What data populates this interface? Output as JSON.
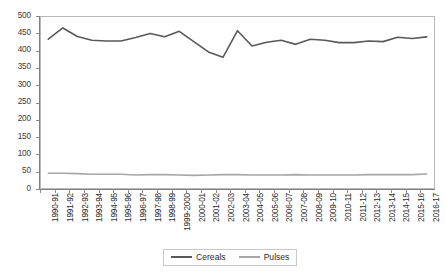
{
  "chart_data": {
    "type": "line",
    "title": "",
    "subtitle": "",
    "xlabel": "",
    "ylabel": "",
    "ylim": [
      0,
      500
    ],
    "ytick_step": 50,
    "yticks": [
      500,
      450,
      400,
      350,
      300,
      250,
      200,
      150,
      100,
      50,
      0
    ],
    "grid": false,
    "legend_position": "bottom-center",
    "categories": [
      "1990-91",
      "1991-92",
      "1992-93",
      "1993-94",
      "1994-95",
      "1995-96",
      "1996-97",
      "1997-98",
      "1998-99",
      "1999-2000",
      "2000-01",
      "2001-02",
      "2002-03",
      "2003-04",
      "2004-05",
      "2005-06",
      "2006-07",
      "2007-08",
      "2008-09",
      "2009-10",
      "2010-11",
      "2011-12",
      "2012-13",
      "2013-14",
      "2014-15",
      "2015-16",
      "2016-17"
    ],
    "series": [
      {
        "name": "Cereals",
        "color": "#595959",
        "values": [
          435,
          468,
          443,
          432,
          430,
          430,
          440,
          452,
          442,
          458,
          428,
          398,
          382,
          460,
          415,
          426,
          432,
          420,
          435,
          432,
          425,
          425,
          430,
          428,
          441,
          437,
          442
        ]
      },
      {
        "name": "Pulses",
        "color": "#a6a6a6",
        "values": [
          43,
          43,
          42,
          40,
          40,
          40,
          38,
          39,
          39,
          38,
          37,
          38,
          39,
          39,
          38,
          38,
          38,
          39,
          38,
          38,
          38,
          38,
          39,
          39,
          39,
          39,
          41
        ]
      }
    ],
    "legend": [
      {
        "label": "Cereals",
        "color": "#595959"
      },
      {
        "label": "Pulses",
        "color": "#a6a6a6"
      }
    ]
  },
  "legend": {
    "cereals_label": "Cereals",
    "pulses_label": "Pulses"
  },
  "colors": {
    "cereals": "#595959",
    "pulses": "#a6a6a6",
    "axis": "#7f7f7f",
    "frame": "#b8b8b8",
    "text": "#2b2b2b",
    "background": "#ffffff"
  }
}
